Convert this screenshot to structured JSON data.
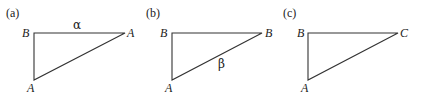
{
  "panels": [
    {
      "label": "(a)",
      "vertices": {
        "top_left": "B",
        "top_right": "A",
        "bottom": "A"
      },
      "edge_label": "α",
      "edge_label_position": "top"
    },
    {
      "label": "(b)",
      "vertices": {
        "top_left": "B",
        "top_right": "B",
        "bottom": "A"
      },
      "edge_label": "β",
      "edge_label_position": "hypotenuse"
    },
    {
      "label": "(c)",
      "vertices": {
        "top_left": "B",
        "top_right": "C",
        "bottom": "A"
      },
      "edge_label": "",
      "edge_label_position": ""
    }
  ],
  "colors": {
    "stroke": "#333333",
    "text": "#222222",
    "background": "#ffffff"
  }
}
